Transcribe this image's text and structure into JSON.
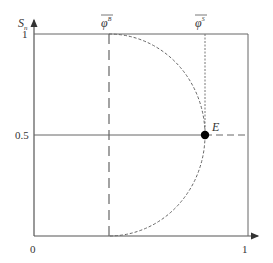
{
  "diagram": {
    "y_axis_label": "S",
    "y_axis_sub": "n",
    "x_ticks": [
      "0",
      "1"
    ],
    "y_ticks": [
      "1",
      "0.5"
    ],
    "phi_b_label": "φ",
    "phi_b_sup": "B",
    "phi_s_label": "φ",
    "phi_s_sup": "S",
    "point_label": "E",
    "colors": {
      "axis": "#555555",
      "curve": "#555555",
      "point": "#000000"
    }
  }
}
